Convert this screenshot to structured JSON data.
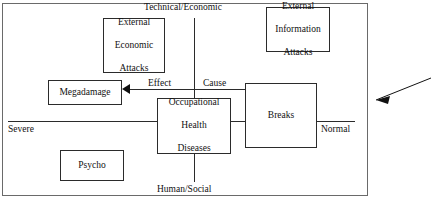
{
  "diagram": {
    "frame": {
      "border_color": "#6a6a6a"
    },
    "axes": {
      "vertical": {
        "top_label": "Technical/Economic",
        "bottom_label": "Human/Social",
        "color": "#2b2b2b"
      },
      "horizontal": {
        "left_label": "Severe",
        "right_label": "Normal",
        "color": "#2b2b2b"
      }
    },
    "boxes": [
      {
        "id": "external-economic-attacks",
        "lines": [
          "External",
          "Economic",
          "Attacks"
        ]
      },
      {
        "id": "external-information-attacks",
        "lines": [
          "External",
          "Information",
          "Attacks"
        ]
      },
      {
        "id": "megadamage",
        "lines": [
          "Megadamage"
        ]
      },
      {
        "id": "occupational-health-diseases",
        "lines": [
          "Occupational",
          "Health",
          "Diseases"
        ]
      },
      {
        "id": "breaks",
        "lines": [
          "Breaks"
        ]
      },
      {
        "id": "psycho",
        "lines": [
          "Psycho"
        ]
      }
    ],
    "flow_labels": {
      "effect": "Effect",
      "cause": "Cause"
    },
    "annotations": {
      "external_pointer": "arrow pointing into right frame edge"
    }
  }
}
